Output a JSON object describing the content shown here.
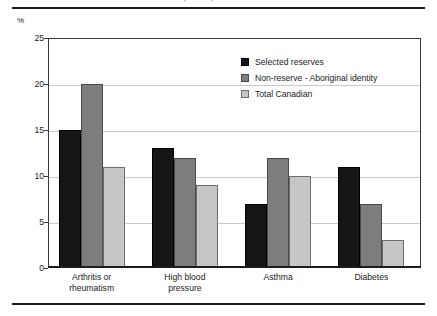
{
  "chart_data": {
    "type": "bar",
    "title": "Chronic conditions, Canada, NPHS 2000-01 and APS 2001/01",
    "subtitle": "",
    "xlabel": "",
    "ylabel": "%",
    "ylim": [
      0,
      25
    ],
    "yticks": [
      0,
      5,
      10,
      15,
      20,
      25
    ],
    "ytick_labels": [
      "0",
      "5",
      "10",
      "15",
      "20",
      "25"
    ],
    "grid": true,
    "legend_position": "upper right",
    "categories": [
      "Arthritis or\nrheumatism",
      "High blood\npressure",
      "Asthma",
      "Diabetes"
    ],
    "category_lines": [
      [
        "Arthritis or",
        "rheumatism"
      ],
      [
        "High blood",
        "pressure"
      ],
      [
        "Asthma",
        ""
      ],
      [
        "Diabetes",
        ""
      ]
    ],
    "series": [
      {
        "name": "Selected reserves",
        "color": "#151515",
        "values": [
          15,
          13,
          7,
          11
        ]
      },
      {
        "name": "Non-reserve - Aboriginal identity",
        "color": "#7d7d7d",
        "values": [
          20,
          12,
          12,
          7
        ]
      },
      {
        "name": "Total Canadian",
        "color": "#c6c6c6",
        "values": [
          11,
          9,
          10,
          3
        ]
      }
    ]
  },
  "axis": {
    "unit_label": "%"
  },
  "legend": {
    "items": [
      {
        "label": "Selected reserves"
      },
      {
        "label": "Non-reserve - Aboriginal identity"
      },
      {
        "label": "Total Canadian"
      }
    ]
  }
}
